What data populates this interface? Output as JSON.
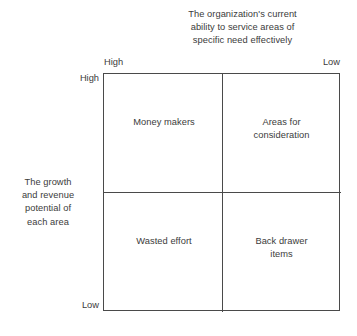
{
  "top_caption": {
    "lines": [
      "The organization's current",
      "ability to service areas of",
      "specific need effectively"
    ]
  },
  "left_caption": {
    "lines": [
      "The growth",
      "and revenue",
      "potential of",
      "each area"
    ]
  },
  "axes": {
    "x_left_label": "High",
    "x_right_label": "Low",
    "y_top_label": "High",
    "y_bottom_label": "Low"
  },
  "quadrants": {
    "top_left": {
      "lines": [
        "Money makers"
      ]
    },
    "top_right": {
      "lines": [
        "Areas for",
        "consideration"
      ]
    },
    "bottom_left": {
      "lines": [
        "Wasted effort"
      ]
    },
    "bottom_right": {
      "lines": [
        "Back drawer",
        "items"
      ]
    }
  },
  "colors": {
    "text": "#3b3b3b",
    "line": "#4a4a4a",
    "background": "#ffffff"
  }
}
